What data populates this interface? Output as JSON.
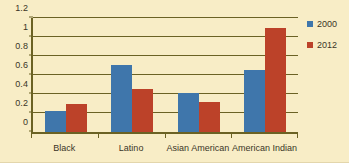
{
  "chart_data": {
    "type": "bar",
    "title": "",
    "xlabel": "",
    "ylabel": "",
    "categories": [
      "Black",
      "Latino",
      "Asian American",
      "American Indian"
    ],
    "series": [
      {
        "name": "2000",
        "color": "#3f76ab",
        "values": [
          0.22,
          0.71,
          0.415,
          0.655
        ]
      },
      {
        "name": "2012",
        "color": "#bc4229",
        "values": [
          0.29,
          0.455,
          0.32,
          1.1
        ]
      }
    ],
    "ylim": [
      0,
      1.2
    ],
    "yticks": [
      0,
      0.2,
      0.4,
      0.6,
      0.8,
      1,
      1.2
    ],
    "ytick_labels": [
      "0",
      "0.2",
      "0.4",
      "0.6",
      "0.8",
      "1",
      "1.2"
    ],
    "grid": true,
    "legend_position": "right",
    "background_color": "#f8edc6",
    "axis_color": "#6b6224"
  },
  "legend": {
    "entries": [
      {
        "label": "2000"
      },
      {
        "label": "2012"
      }
    ]
  }
}
